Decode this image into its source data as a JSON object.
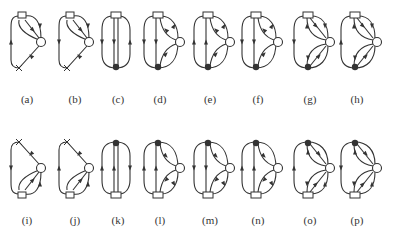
{
  "figure": {
    "rows": [
      {
        "panels": [
          {
            "label": "(a)",
            "x": 27,
            "kind": "x-loop",
            "flip": false,
            "arrows": "up"
          },
          {
            "label": "(b)",
            "x": 75,
            "kind": "x-loop",
            "flip": false,
            "arrows": "down"
          },
          {
            "label": "(c)",
            "x": 118,
            "kind": "vertical",
            "flip": false
          },
          {
            "label": "(d)",
            "x": 160,
            "kind": "three",
            "flip": false,
            "arrows": "down"
          },
          {
            "label": "(e)",
            "x": 210,
            "kind": "three",
            "flip": false,
            "arrows": "up"
          },
          {
            "label": "(f)",
            "x": 258,
            "kind": "three",
            "flip": false,
            "arrows": "down"
          },
          {
            "label": "(g)",
            "x": 310,
            "kind": "four",
            "flip": false,
            "arrows": "down"
          },
          {
            "label": "(h)",
            "x": 357,
            "kind": "four",
            "flip": false,
            "arrows": "up"
          }
        ]
      },
      {
        "panels": [
          {
            "label": "(i)",
            "x": 27,
            "kind": "x-loop",
            "flip": true,
            "arrows": "up"
          },
          {
            "label": "(j)",
            "x": 75,
            "kind": "x-loop",
            "flip": true,
            "arrows": "down"
          },
          {
            "label": "(k)",
            "x": 118,
            "kind": "vertical",
            "flip": true
          },
          {
            "label": "(l)",
            "x": 160,
            "kind": "three",
            "flip": true,
            "arrows": "down"
          },
          {
            "label": "(m)",
            "x": 210,
            "kind": "three",
            "flip": true,
            "arrows": "up"
          },
          {
            "label": "(n)",
            "x": 258,
            "kind": "three",
            "flip": true,
            "arrows": "down"
          },
          {
            "label": "(o)",
            "x": 310,
            "kind": "four",
            "flip": true,
            "arrows": "down"
          },
          {
            "label": "(p)",
            "x": 357,
            "kind": "four",
            "flip": true,
            "arrows": "up"
          }
        ]
      }
    ],
    "stroke_color": "#333333"
  }
}
